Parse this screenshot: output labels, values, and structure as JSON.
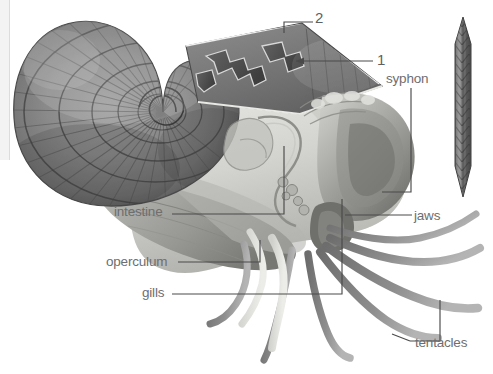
{
  "figure": {
    "background_color": "#ffffff",
    "label_color": "#6e6e6e",
    "leader_color": "#4a4a4a",
    "width": 493,
    "height": 374
  },
  "labels": {
    "intestine": "intestine",
    "operculum": "operculum",
    "gills": "gills",
    "syphon": "syphon",
    "jaws": "jaws",
    "tentacles": "tentacles",
    "callout_one": "1",
    "callout_two": "2"
  },
  "illustration": {
    "shell_name": "coiled-ribbed-shell",
    "shell_tone_dark": "#6b6b6b",
    "shell_tone_mid": "#8f8f8f",
    "shell_tone_light": "#c8c8c8",
    "body_tone": "#d8d8d4",
    "tentacle_tone": "#8a8a8a",
    "edge_view_name": "shell-edge-on-view"
  }
}
